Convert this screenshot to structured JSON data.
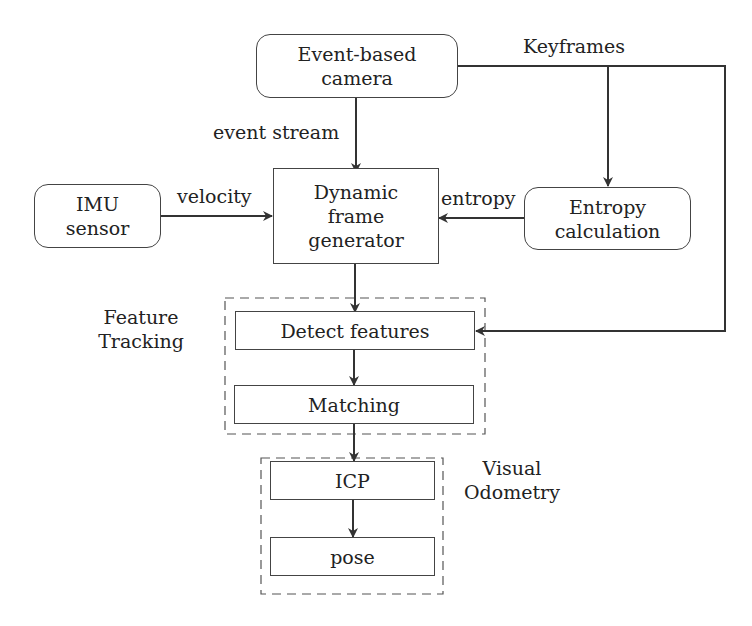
{
  "diagram": {
    "nodes": {
      "camera": {
        "line1": "Event-based",
        "line2": "camera"
      },
      "imu": {
        "line1": "IMU",
        "line2": "sensor"
      },
      "generator": {
        "line1": "Dynamic",
        "line2": "frame",
        "line3": "generator"
      },
      "entropy": {
        "line1": "Entropy",
        "line2": "calculation"
      },
      "detect": {
        "label": "Detect features"
      },
      "matching": {
        "label": "Matching"
      },
      "icp": {
        "label": "ICP"
      },
      "pose": {
        "label": "pose"
      }
    },
    "edge_labels": {
      "keyframes": "Keyframes",
      "event_stream": "event stream",
      "velocity": "velocity",
      "entropy": "entropy"
    },
    "groups": {
      "feature_tracking": {
        "line1": "Feature",
        "line2": "Tracking"
      },
      "visual_odometry": {
        "line1": "Visual",
        "line2": "Odometry"
      }
    },
    "colors": {
      "stroke": "#333333",
      "background": "#ffffff"
    }
  }
}
